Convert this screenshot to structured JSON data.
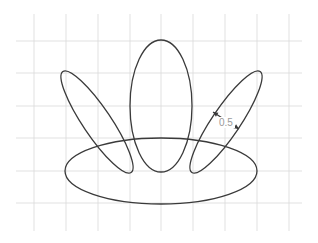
{
  "diagram": {
    "grid": {
      "x_lines": [
        34,
        66,
        98,
        130,
        161,
        193,
        225,
        257,
        289
      ],
      "y_lines": [
        41,
        73,
        106,
        138,
        171,
        203
      ],
      "x_extent": [
        16,
        302
      ],
      "y_extent": [
        14,
        231
      ],
      "color": "#d9d9d9"
    },
    "ellipses": [
      {
        "name": "base",
        "cx": 161,
        "cy": 171,
        "rx": 96,
        "ry": 33,
        "rotate": 0
      },
      {
        "name": "center",
        "cx": 161,
        "cy": 106,
        "rx": 31,
        "ry": 66,
        "rotate": 0
      },
      {
        "name": "left",
        "cx": 97,
        "cy": 122,
        "rx": 61,
        "ry": 14,
        "rotate": 56
      },
      {
        "name": "right",
        "cx": 226,
        "cy": 122,
        "rx": 61,
        "ry": 14,
        "rotate": -56
      }
    ],
    "stroke_color": "#3a3a3a",
    "dimension": {
      "label": "0.5",
      "x1": 213,
      "y1": 112,
      "x2": 239,
      "y2": 129,
      "text_x": 219,
      "text_y": 126,
      "text_color": "#9a9a9a"
    }
  }
}
